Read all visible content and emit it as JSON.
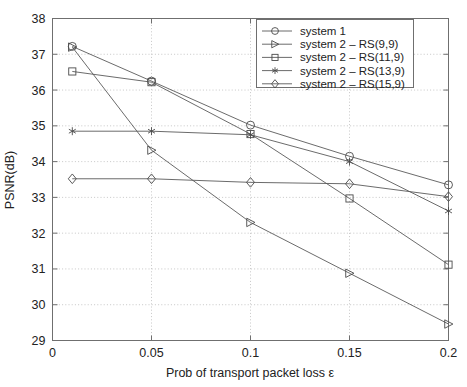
{
  "chart_data": {
    "type": "line",
    "title": "",
    "xlabel": "Prob of transport packet loss ε",
    "ylabel": "PSNR(dB)",
    "xlim": [
      0,
      0.2
    ],
    "ylim": [
      29,
      38
    ],
    "xticks": [
      0,
      0.05,
      0.1,
      0.15,
      0.2
    ],
    "xticklabels": [
      "0",
      "0.05",
      "0.1",
      "0.15",
      "0.2"
    ],
    "yticks": [
      29,
      30,
      31,
      32,
      33,
      34,
      35,
      36,
      37,
      38
    ],
    "yticklabels": [
      "29",
      "30",
      "31",
      "32",
      "33",
      "34",
      "35",
      "36",
      "37",
      "38"
    ],
    "grid": true,
    "legend_position": "upper right",
    "x": [
      0.01,
      0.05,
      0.1,
      0.15,
      0.2
    ],
    "series": [
      {
        "name": "system 1",
        "marker": "circle",
        "values": [
          37.22,
          36.25,
          35.02,
          34.15,
          33.35
        ]
      },
      {
        "name": "system 2 – RS(9,9)",
        "marker": "right-triangle",
        "values": [
          37.2,
          34.32,
          32.3,
          30.88,
          29.46
        ]
      },
      {
        "name": "system 2 – RS(11,9)",
        "marker": "square",
        "values": [
          36.52,
          36.22,
          34.77,
          32.97,
          31.12
        ]
      },
      {
        "name": "system 2 – RS(13,9)",
        "marker": "asterisk",
        "values": [
          34.85,
          34.85,
          34.75,
          34.0,
          32.62
        ]
      },
      {
        "name": "system 2 – RS(15,9)",
        "marker": "diamond",
        "values": [
          33.52,
          33.52,
          33.42,
          33.38,
          33.02
        ]
      }
    ]
  },
  "colors": {
    "line": "#5a5a5a",
    "marker": "#4a4a4a",
    "frame": "#6f6f6f",
    "grid": "#b9b9b9",
    "text": "#222222",
    "background": "#ffffff"
  }
}
